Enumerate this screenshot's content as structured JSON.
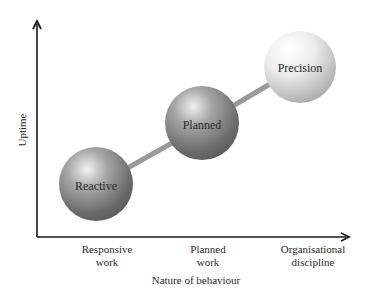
{
  "diagram": {
    "x_axis_label": "Nature of behaviour",
    "y_axis_label": "Uptime",
    "x_ticks": [
      {
        "lines": [
          "Responsive",
          "work"
        ]
      },
      {
        "lines": [
          "Planned",
          "work"
        ]
      },
      {
        "lines": [
          "Organisational",
          "discipline"
        ]
      }
    ],
    "stages": [
      {
        "label": "Reactive",
        "shade": "dark"
      },
      {
        "label": "Planned",
        "shade": "medium"
      },
      {
        "label": "Precision",
        "shade": "light"
      }
    ],
    "colors": {
      "axis": "#1a1a1a",
      "connector": "#9a9a9a",
      "text": "#2a2a2a"
    }
  }
}
